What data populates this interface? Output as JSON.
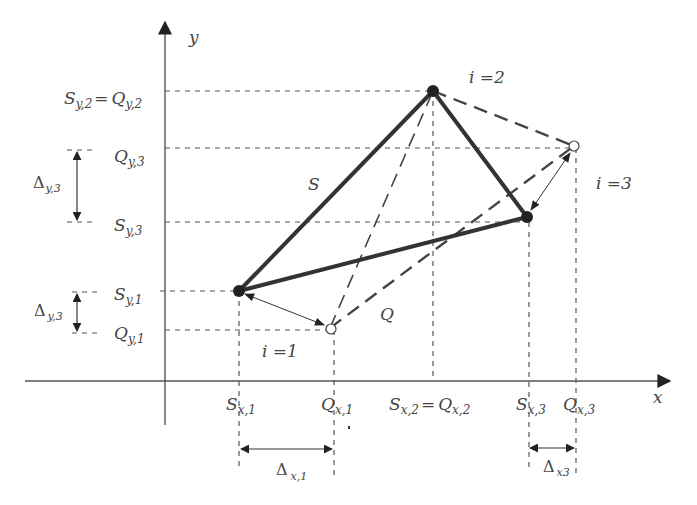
{
  "diagram": {
    "axes": {
      "x_label": "x",
      "y_label": "y"
    },
    "polygons": {
      "S": {
        "label": "S",
        "style": "solid-thick",
        "points": [
          {
            "i": 1,
            "x": 239,
            "y": 291
          },
          {
            "i": 2,
            "x": 433,
            "y": 91
          },
          {
            "i": 3,
            "x": 527,
            "y": 217
          }
        ]
      },
      "Q": {
        "label": "Q",
        "style": "dashed",
        "points": [
          {
            "i": 1,
            "x": 330,
            "y": 328
          },
          {
            "i": 2,
            "x": 433,
            "y": 91
          },
          {
            "i": 3,
            "x": 574,
            "y": 146
          }
        ]
      }
    },
    "vertex_labels": {
      "i1": "i =1",
      "i2": "i =2",
      "i3": "i =3"
    },
    "y_ticks": {
      "sy2_qy2": {
        "S": "S",
        "S_sub": "y,2",
        "eq": "=",
        "Q": "Q",
        "Q_sub": "y,2"
      },
      "qy3": {
        "Q": "Q",
        "Q_sub": "y,3"
      },
      "sy3": {
        "S": "S",
        "S_sub": "y,3"
      },
      "sy1": {
        "S": "S",
        "S_sub": "y,1"
      },
      "qy1": {
        "Q": "Q",
        "Q_sub": "y,1"
      }
    },
    "x_ticks": {
      "sx1": {
        "S": "S",
        "S_sub": "x,1"
      },
      "qx1": {
        "Q": "Q",
        "Q_sub": "x,1"
      },
      "sx2_qx2": {
        "S": "S",
        "S_sub": "x,2",
        "eq": "=",
        "Q": "Q",
        "Q_sub": "x,2"
      },
      "sx3": {
        "S": "S",
        "S_sub": "x,3"
      },
      "qx3": {
        "Q": "Q",
        "Q_sub": "x,3"
      }
    },
    "deltas": {
      "dy3_top": {
        "symbol": "Δ",
        "sub": "y,3"
      },
      "dy3_bottom": {
        "symbol": "Δ",
        "sub": "y,3"
      },
      "dx1": {
        "symbol": "Δ",
        "sub": "x,1"
      },
      "dx3": {
        "symbol": "Δ",
        "sub": "x3"
      }
    }
  }
}
